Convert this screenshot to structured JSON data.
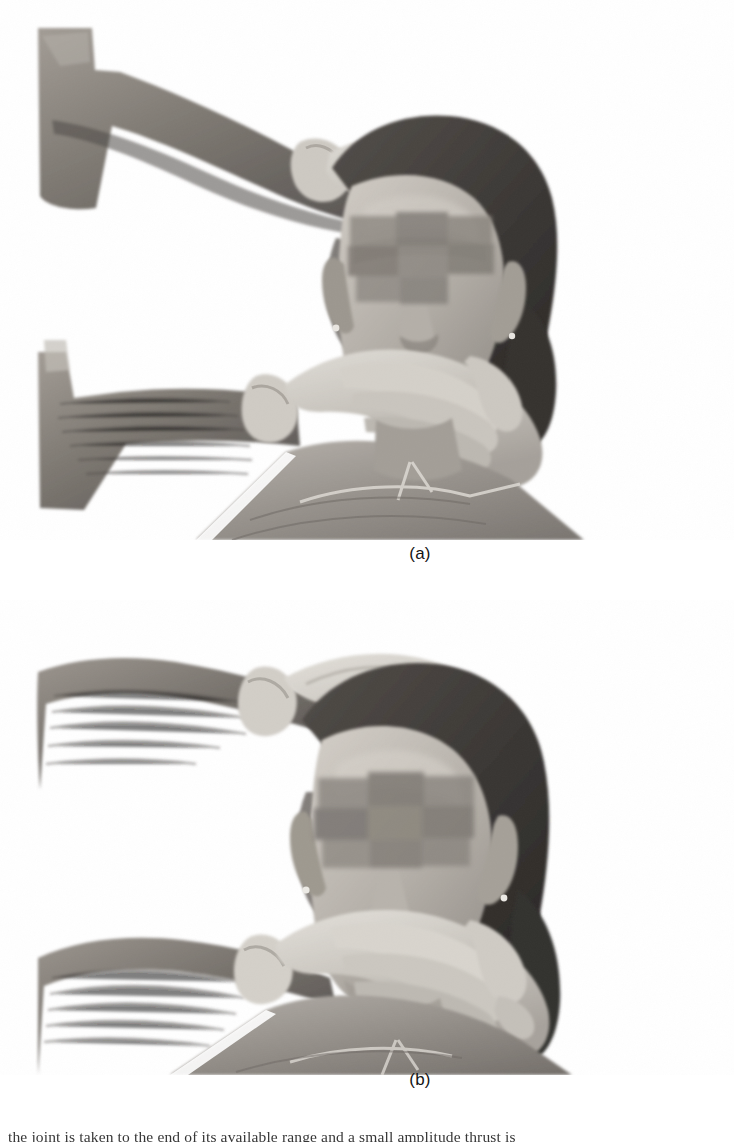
{
  "page": {
    "background_color": "#ffffff",
    "kind": "textbook-figure-page",
    "width": 734,
    "height": 1142
  },
  "figure": {
    "panels": [
      {
        "id": "a",
        "caption": "(a)",
        "photo_name": "clinical-photo-cervical-technique-a",
        "description": "Black and white clinical photograph: clinician's gloved hand on top of the seated patient's head, other gloved hand cupping the chin and jaw; patient wears a protective gown; eye region anonymised with grey blocks."
      },
      {
        "id": "b",
        "caption": "(b)",
        "photo_name": "clinical-photo-cervical-technique-b",
        "description": "Black and white clinical photograph: same hold from a closer, more frontal view; clinician's upper hand rests on the crown, lower hand cradles the mandible; patient's eye region anonymised with grey blocks."
      }
    ]
  },
  "photo_palette": {
    "background": "#ffffff",
    "skin_light": "#c9c4bd",
    "skin_mid": "#a8a29a",
    "skin_dark": "#7d7770",
    "hair_dark": "#3d3a37",
    "hair_mid": "#5a5550",
    "glove_light": "#d6d2cb",
    "glove_mid": "#b9b5ae",
    "arm_hair_dark": "#474340",
    "gown_mid": "#9d9892",
    "gown_light": "#bdb8b2",
    "gown_dark": "#7b7671",
    "anonymise_block": "#8b8680"
  },
  "body_text": {
    "cropped_line": "the joint is taken to the end of its available range and a small amplitude thrust is"
  }
}
